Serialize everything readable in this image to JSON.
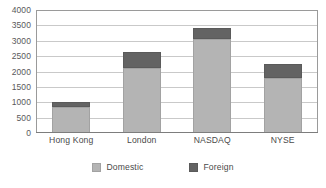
{
  "chart_data": {
    "type": "bar",
    "stacked": true,
    "title": "",
    "subtitle": "",
    "xlabel": "",
    "ylabel": "",
    "categories": [
      "Hong Kong",
      "London",
      "NASDAQ",
      "NYSE"
    ],
    "series": [
      {
        "name": "Domestic",
        "color": "#b4b4b4",
        "values": [
          850,
          2100,
          3050,
          1800
        ]
      },
      {
        "name": "Foreign",
        "color": "#636363",
        "values": [
          150,
          550,
          350,
          450
        ]
      }
    ],
    "totals": [
      1000,
      2650,
      3400,
      2250
    ],
    "ylim": [
      0,
      4000
    ],
    "ytick_step": 500,
    "yticks": [
      "4000",
      "3500",
      "3000",
      "2500",
      "2000",
      "1500",
      "1000",
      "500",
      "0"
    ],
    "ytick_values": [
      4000,
      3500,
      3000,
      2500,
      2000,
      1500,
      1000,
      500,
      0
    ],
    "grid": true,
    "grid_axis": "y",
    "grid_color": "#c9c9c9",
    "legend_position": "bottom",
    "legend": [
      {
        "label": "Domestic",
        "swatch": "domestic-swatch",
        "color": "#b4b4b4"
      },
      {
        "label": "Foreign",
        "swatch": "foreign-swatch",
        "color": "#636363"
      }
    ],
    "plot_border_color": "#9a9a9a",
    "background": "#ffffff"
  }
}
